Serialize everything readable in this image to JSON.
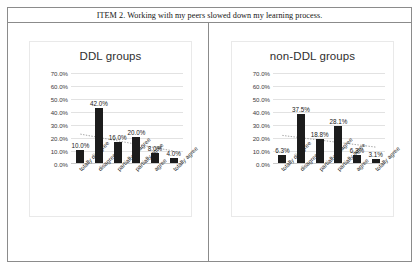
{
  "table": {
    "header": "ITEM 2. Working with my peers slowed down my learning process."
  },
  "axis": {
    "yticks": [
      "70.0%",
      "60.0%",
      "50.0%",
      "40.0%",
      "30.0%",
      "20.0%",
      "10.0%",
      "0.0%"
    ],
    "categories": [
      "totally disagree",
      "disagree",
      "partially disagree",
      "partially agree",
      "agree",
      "totally agree"
    ]
  },
  "left_chart": {
    "title": "DDL groups",
    "labels": [
      "10.0%",
      "42.0%",
      "16.0%",
      "20.0%",
      "8.0%",
      "4.0%"
    ]
  },
  "right_chart": {
    "title": "non-DDL groups",
    "labels": [
      "6.3%",
      "37.5%",
      "18.8%",
      "28.1%",
      "6.3%",
      "3.1%"
    ]
  },
  "colors": {
    "bar": "#1c1c1c",
    "grid": "#e2e2e2",
    "border": "#8b8b8b",
    "trendline": "#9a9a9a"
  },
  "chart_data": [
    {
      "type": "bar",
      "title": "DDL groups",
      "categories": [
        "totally disagree",
        "disagree",
        "partially disagree",
        "partially agree",
        "agree",
        "totally agree"
      ],
      "values": [
        10.0,
        42.0,
        16.0,
        20.0,
        8.0,
        4.0
      ],
      "data_labels": [
        "10.0%",
        "42.0%",
        "16.0%",
        "20.0%",
        "8.0%",
        "4.0%"
      ],
      "xlabel": "",
      "ylabel": "",
      "ylim": [
        0,
        70
      ],
      "ytick_values": [
        0,
        10,
        20,
        30,
        40,
        50,
        60,
        70
      ],
      "ytick_labels": [
        "0.0%",
        "10.0%",
        "20.0%",
        "30.0%",
        "40.0%",
        "50.0%",
        "60.0%",
        "70.0%"
      ],
      "grid": true,
      "legend": false,
      "trendline": {
        "type": "linear",
        "style": "dotted",
        "start": 23.0,
        "end": 10.0
      }
    },
    {
      "type": "bar",
      "title": "non-DDL groups",
      "categories": [
        "totally disagree",
        "disagree",
        "partially disagree",
        "partially agree",
        "agree",
        "totally agree"
      ],
      "values": [
        6.3,
        37.5,
        18.8,
        28.1,
        6.3,
        3.1
      ],
      "data_labels": [
        "6.3%",
        "37.5%",
        "18.8%",
        "28.1%",
        "6.3%",
        "3.1%"
      ],
      "xlabel": "",
      "ylabel": "",
      "ylim": [
        0,
        70
      ],
      "ytick_values": [
        0,
        10,
        20,
        30,
        40,
        50,
        60,
        70
      ],
      "ytick_labels": [
        "0.0%",
        "10.0%",
        "20.0%",
        "30.0%",
        "40.0%",
        "50.0%",
        "60.0%",
        "70.0%"
      ],
      "grid": true,
      "legend": false,
      "trendline": {
        "type": "linear",
        "style": "dotted",
        "start": 22.0,
        "end": 13.0
      }
    }
  ]
}
